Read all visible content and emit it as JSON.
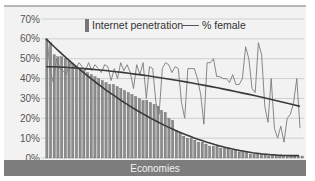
{
  "chart_data": {
    "type": "bar",
    "title": "",
    "xlabel": "Economies",
    "ylabel": "",
    "ylim": [
      0,
      70
    ],
    "yticks": [
      "0%",
      "10%",
      "20%",
      "30%",
      "40%",
      "50%",
      "60%",
      "70%"
    ],
    "grid": true,
    "legend_position": "top-center",
    "legend": [
      "Internet penetration",
      "% female"
    ],
    "series": [
      {
        "name": "Internet penetration",
        "type": "bar",
        "values": [
          60,
          58,
          52,
          51,
          51,
          50,
          49,
          47,
          46,
          45,
          44,
          43,
          42,
          41,
          40,
          39,
          38,
          37,
          37,
          36,
          35,
          34,
          33,
          32,
          31,
          30,
          29,
          29,
          28,
          27,
          26,
          24,
          23,
          20,
          19,
          14,
          13,
          11,
          10,
          10,
          9,
          8,
          8,
          7,
          6,
          6,
          6,
          5,
          5,
          5,
          4,
          4,
          3,
          3,
          3,
          2,
          2,
          2,
          2,
          2,
          1,
          1,
          1,
          1,
          1,
          1,
          1,
          1,
          1,
          1
        ]
      },
      {
        "name": "% female",
        "type": "line",
        "values": [
          60,
          44,
          38,
          50,
          45,
          44,
          42,
          47,
          48,
          45,
          48,
          46,
          44,
          48,
          44,
          47,
          45,
          43,
          47,
          46,
          39,
          45,
          40,
          48,
          44,
          47,
          43,
          35,
          47,
          42,
          48,
          30,
          46,
          45,
          28,
          22,
          45,
          48,
          47,
          43,
          46,
          45,
          28,
          20,
          45,
          45,
          45,
          40,
          32,
          17,
          48,
          48,
          50,
          41,
          41,
          40,
          40,
          38,
          42,
          37,
          37,
          40,
          56,
          50,
          35,
          33,
          58,
          52,
          26,
          18,
          40,
          15,
          10,
          16,
          8,
          20,
          22,
          28,
          40,
          15
        ]
      },
      {
        "name": "Internet penetration trend",
        "type": "line",
        "values": [
          60,
          0
        ]
      },
      {
        "name": "% female trend",
        "type": "line",
        "values": [
          46,
          26
        ]
      }
    ]
  },
  "axis": {
    "yticks": [
      "70%",
      "60%",
      "50%",
      "40%",
      "30%",
      "20%",
      "10%",
      "0%"
    ]
  },
  "legend": {
    "bar_label": "Internet penetration",
    "line_label": "% female"
  },
  "xband": {
    "label": "Economies"
  },
  "colors": {
    "bar": "#8c8c8c",
    "bar_edge": "#5a5a5a",
    "female_line": "#7a7a7a",
    "trend": "#3a3a3a",
    "band": "#7d7d7d",
    "grid": "#cfcfcf",
    "background": "#f2f2f2"
  }
}
